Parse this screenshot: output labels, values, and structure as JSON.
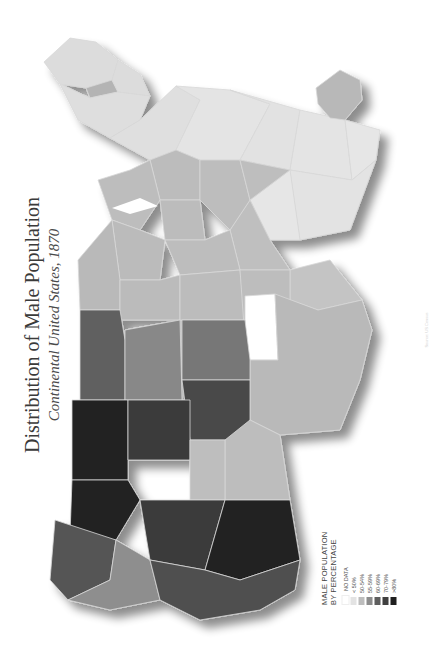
{
  "title": "Distribution of Male Population",
  "subtitle": "Continental United States, 1870",
  "orientation_note": "Map rotated 90° clockwise; north points left",
  "legend": {
    "title_line1": "MALE POPULATION",
    "title_line2": "BY PERCENTAGE",
    "items": [
      {
        "label": "NO DATA",
        "color": "#ffffff"
      },
      {
        "label": "< 50%",
        "color": "#e3e3e3"
      },
      {
        "label": "50-54%",
        "color": "#bdbdbd"
      },
      {
        "label": "55-59%",
        "color": "#8c8c8c"
      },
      {
        "label": "60-69%",
        "color": "#5e5e5e"
      },
      {
        "label": "70-79%",
        "color": "#404040"
      },
      {
        "label": ">80%",
        "color": "#1f1f1f"
      }
    ]
  },
  "source_text": "Source: US Census",
  "colors": {
    "background": "#ffffff",
    "state_border": "#d8d8d8",
    "shadow": "#9a9a9a"
  }
}
